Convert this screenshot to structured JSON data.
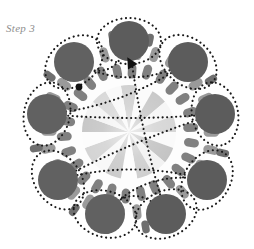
{
  "figure": {
    "step_label": "Step 3",
    "canvas": {
      "width": 254,
      "height": 249
    },
    "background_color": "#ffffff"
  },
  "colors": {
    "label_text": "#8e8e8e",
    "large_circle": "#5c5c5c",
    "large_circle_alt": "#616161",
    "rod_outer": "#9a9a9a",
    "rod_inner": "#808080",
    "rod_dark": "#6f6f6f",
    "wedge_light": "#fbfbfb",
    "wedge_mid": "#d2d2d2",
    "wedge_dark": "#bdbdbd",
    "dotted_path": "#1a1a1a",
    "arrow_marker": "#111111",
    "core_halo": "#efefef"
  },
  "structure": {
    "center": {
      "x": 129,
      "y": 132
    },
    "core_radius": 47,
    "rod_ring_radius": 63,
    "outer_ring_radius": 92,
    "wedge_count": 18,
    "rod_count_inner": 26,
    "rod_count_outer": 30,
    "large_circle_count": 9,
    "large_circle_radius": 19
  },
  "large_circles": [
    {
      "id": "circle-top",
      "x": 129,
      "y": 41,
      "r": 20
    },
    {
      "id": "circle-upper-left",
      "x": 74,
      "y": 62,
      "r": 20
    },
    {
      "id": "circle-upper-right",
      "x": 188,
      "y": 62,
      "r": 20
    },
    {
      "id": "circle-left",
      "x": 47,
      "y": 114,
      "r": 20
    },
    {
      "id": "circle-right",
      "x": 215,
      "y": 114,
      "r": 20
    },
    {
      "id": "circle-lower-left",
      "x": 58,
      "y": 180,
      "r": 20
    },
    {
      "id": "circle-lower-right",
      "x": 207,
      "y": 180,
      "r": 20
    },
    {
      "id": "circle-bottom-left",
      "x": 105,
      "y": 214,
      "r": 20
    },
    {
      "id": "circle-bottom-right",
      "x": 166,
      "y": 214,
      "r": 20
    }
  ],
  "markers": {
    "arrowhead": {
      "x": 130,
      "y": 62,
      "rotation": -120,
      "label": "arrowhead-marker"
    },
    "dot": {
      "x": 79,
      "y": 87,
      "r": 3.4,
      "label": "dot-marker"
    }
  },
  "chart_data": {
    "type": "pie",
    "title": "Step 3",
    "categories": [
      "w1",
      "w2",
      "w3",
      "w4",
      "w5",
      "w6",
      "w7",
      "w8",
      "w9",
      "w10",
      "w11",
      "w12",
      "w13",
      "w14",
      "w15",
      "w16",
      "w17",
      "w18"
    ],
    "values": [
      1,
      1,
      1,
      1,
      1,
      1,
      1,
      1,
      1,
      1,
      1,
      1,
      1,
      1,
      1,
      1,
      1,
      1
    ],
    "slice_colors": [
      "#d2d2d2",
      "#fbfbfb",
      "#c9c9c9",
      "#f6f6f6",
      "#d6d6d6",
      "#fafafa",
      "#c4c4c4",
      "#f2f2f2",
      "#cfcfcf",
      "#fdfdfd",
      "#cbcbcb",
      "#f8f8f8",
      "#d4d4d4",
      "#fcfcfc",
      "#c7c7c7",
      "#f4f4f4",
      "#d9d9d9",
      "#f9f9f9"
    ],
    "legend": [],
    "xlabel": "",
    "ylabel": "",
    "grid": false
  }
}
